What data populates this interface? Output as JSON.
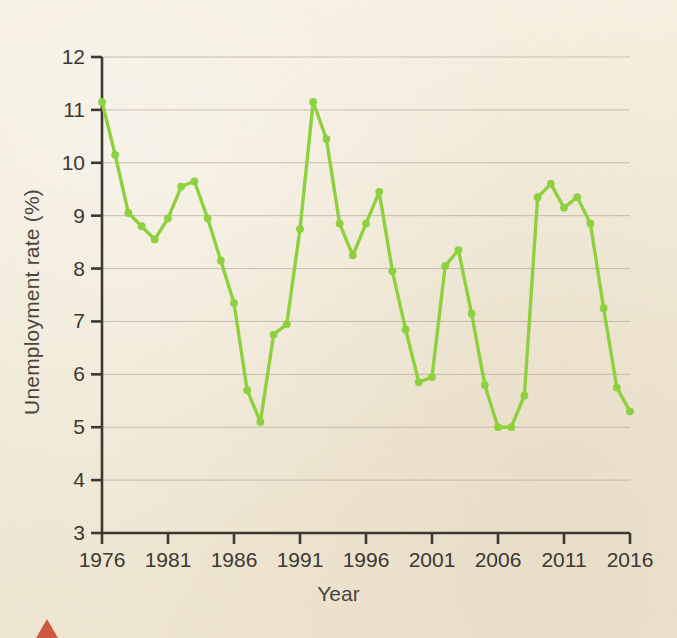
{
  "figure": {
    "background_color": "#f3ebd9",
    "line_color": "#8ed13f",
    "axis_color": "#3c3833",
    "grid_color": "#b9ada0",
    "marker_color": "#8ed13f",
    "corner_mark_color": "#c9462f"
  },
  "chart_data": {
    "type": "line",
    "title": "",
    "xlabel": "Year",
    "ylabel": "Unemployment rate (%)",
    "xlim": [
      1976,
      2016
    ],
    "ylim": [
      3,
      12
    ],
    "ytick_labels": [
      "12",
      "11",
      "10",
      "9",
      "8",
      "7",
      "6",
      "5",
      "4",
      "3"
    ],
    "yticks": [
      12,
      11,
      10,
      9,
      8,
      7,
      6,
      5,
      4,
      3
    ],
    "xtick_labels": [
      "1976",
      "1981",
      "1986",
      "1991",
      "1996",
      "2001",
      "2006",
      "2011",
      "2016"
    ],
    "xticks": [
      1976,
      1981,
      1986,
      1991,
      1996,
      2001,
      2006,
      2011,
      2016
    ],
    "grid": "horizontal",
    "legend": "none",
    "markers": true,
    "series": [
      {
        "name": "Unemployment rate",
        "color": "#8ed13f",
        "x": [
          1976,
          1977,
          1978,
          1979,
          1980,
          1981,
          1982,
          1983,
          1984,
          1985,
          1986,
          1987,
          1988,
          1989,
          1990,
          1991,
          1992,
          1993,
          1994,
          1995,
          1996,
          1997,
          1998,
          1999,
          2000,
          2001,
          2002,
          2003,
          2004,
          2005,
          2006,
          2007,
          2008,
          2009,
          2010,
          2011,
          2012,
          2013,
          2014,
          2015,
          2016
        ],
        "values": [
          11.15,
          10.15,
          9.05,
          8.8,
          8.55,
          8.95,
          9.55,
          9.65,
          8.95,
          8.15,
          7.35,
          5.7,
          5.1,
          6.75,
          6.95,
          8.75,
          11.15,
          10.45,
          8.85,
          8.25,
          8.85,
          9.45,
          7.95,
          6.85,
          5.85,
          5.95,
          8.05,
          8.35,
          7.15,
          5.8,
          5.0,
          5.0,
          5.6,
          9.35,
          9.6,
          9.15,
          9.35,
          8.85,
          7.25,
          5.75,
          5.3
        ]
      }
    ]
  }
}
